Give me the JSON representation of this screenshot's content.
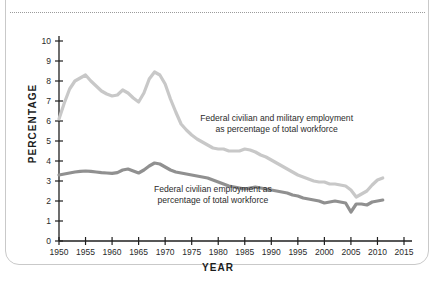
{
  "card": {
    "divider": "dotted-rule"
  },
  "chart_data": {
    "type": "line",
    "title": "",
    "xlabel": "YEAR",
    "ylabel": "PERCENTAGE",
    "xlim": [
      1950,
      2015
    ],
    "ylim": [
      0,
      10
    ],
    "xticks": [
      "1950",
      "1955",
      "1960",
      "1965",
      "1970",
      "1975",
      "1980",
      "1985",
      "1990",
      "1995",
      "2000",
      "2005",
      "2010",
      "2015"
    ],
    "yticks": [
      "0",
      "1",
      "2",
      "3",
      "4",
      "5",
      "6",
      "7",
      "8",
      "9",
      "10"
    ],
    "grid": false,
    "legend_position": "inline-annotations",
    "annotations": [
      {
        "name": "upper-series-annotation",
        "line1": "Federal civilian and military employment",
        "line2": "as percentage of total workforce",
        "x": 1991,
        "y": 6.0
      },
      {
        "name": "lower-series-annotation",
        "line1": "Federal civilian employment as",
        "line2": "percentage of total workforce",
        "x": 1979,
        "y": 2.45
      }
    ],
    "series": [
      {
        "name": "Federal civilian and military employment as percentage of total workforce",
        "color": "#c8c8c8",
        "x": [
          1950,
          1951,
          1952,
          1953,
          1954,
          1955,
          1956,
          1957,
          1958,
          1959,
          1960,
          1961,
          1962,
          1963,
          1964,
          1965,
          1966,
          1967,
          1968,
          1969,
          1970,
          1971,
          1972,
          1973,
          1974,
          1975,
          1976,
          1977,
          1978,
          1979,
          1980,
          1981,
          1982,
          1983,
          1984,
          1985,
          1986,
          1987,
          1988,
          1989,
          1990,
          1991,
          1992,
          1993,
          1994,
          1995,
          1996,
          1997,
          1998,
          1999,
          2000,
          2001,
          2002,
          2003,
          2004,
          2005,
          2006,
          2007,
          2008,
          2009,
          2010,
          2011
        ],
        "values": [
          6.1,
          6.9,
          7.6,
          8.0,
          8.15,
          8.3,
          8.0,
          7.75,
          7.5,
          7.35,
          7.25,
          7.3,
          7.55,
          7.4,
          7.15,
          6.95,
          7.4,
          8.1,
          8.45,
          8.3,
          7.85,
          7.1,
          6.45,
          5.85,
          5.55,
          5.3,
          5.1,
          4.95,
          4.8,
          4.65,
          4.6,
          4.6,
          4.5,
          4.5,
          4.5,
          4.6,
          4.55,
          4.45,
          4.3,
          4.2,
          4.05,
          3.9,
          3.75,
          3.6,
          3.45,
          3.3,
          3.2,
          3.1,
          3.0,
          2.95,
          2.95,
          2.85,
          2.85,
          2.8,
          2.75,
          2.55,
          2.2,
          2.35,
          2.5,
          2.8,
          3.05,
          3.15
        ]
      },
      {
        "name": "Federal civilian employment as percentage of total workforce",
        "color": "#909090",
        "x": [
          1950,
          1951,
          1952,
          1953,
          1954,
          1955,
          1956,
          1957,
          1958,
          1959,
          1960,
          1961,
          1962,
          1963,
          1964,
          1965,
          1966,
          1967,
          1968,
          1969,
          1970,
          1971,
          1972,
          1973,
          1974,
          1975,
          1976,
          1977,
          1978,
          1979,
          1980,
          1981,
          1982,
          1983,
          1984,
          1985,
          1986,
          1987,
          1988,
          1989,
          1990,
          1991,
          1992,
          1993,
          1994,
          1995,
          1996,
          1997,
          1998,
          1999,
          2000,
          2001,
          2002,
          2003,
          2004,
          2005,
          2006,
          2007,
          2008,
          2009,
          2010,
          2011
        ],
        "values": [
          3.3,
          3.35,
          3.4,
          3.45,
          3.48,
          3.5,
          3.48,
          3.45,
          3.42,
          3.4,
          3.38,
          3.42,
          3.55,
          3.6,
          3.5,
          3.4,
          3.55,
          3.75,
          3.9,
          3.85,
          3.7,
          3.55,
          3.45,
          3.4,
          3.35,
          3.3,
          3.25,
          3.2,
          3.15,
          3.05,
          2.95,
          2.85,
          2.75,
          2.7,
          2.65,
          2.6,
          2.65,
          2.7,
          2.65,
          2.6,
          2.55,
          2.5,
          2.45,
          2.4,
          2.3,
          2.25,
          2.15,
          2.1,
          2.05,
          2.0,
          1.9,
          1.95,
          2.0,
          1.95,
          1.9,
          1.45,
          1.85,
          1.85,
          1.8,
          1.95,
          2.0,
          2.05
        ]
      }
    ]
  }
}
